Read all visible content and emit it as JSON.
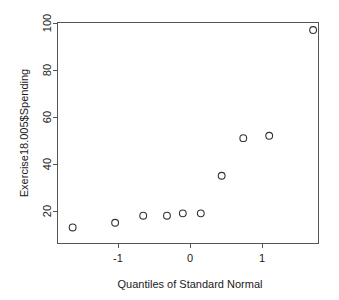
{
  "chart_data": {
    "type": "scatter",
    "title": "",
    "subtitle": "",
    "xlabel": "Quantiles of Standard Normal",
    "ylabel": "Exercise18.005$Spending",
    "xlim": [
      -1.95,
      1.95
    ],
    "ylim": [
      10.0,
      101.5
    ],
    "xticks": [
      -1,
      0,
      1
    ],
    "xtick_labels": [
      "-1",
      "0",
      "1"
    ],
    "yticks": [
      20,
      40,
      60,
      80,
      100
    ],
    "ytick_labels": [
      "20",
      "40",
      "60",
      "80",
      "100"
    ],
    "grid": false,
    "legend": null,
    "marker": "open-circle",
    "series": [
      {
        "name": "Spending quantiles",
        "x": [
          -1.63,
          -1.04,
          -0.65,
          -0.32,
          -0.1,
          0.15,
          0.44,
          0.74,
          1.1,
          1.71
        ],
        "y": [
          13,
          15,
          18,
          18,
          19,
          19,
          35,
          51,
          52,
          97
        ]
      }
    ]
  },
  "axes": {
    "x_axis_name": "Quantiles of Standard Normal",
    "y_axis_name": "Exercise18.005$Spending"
  },
  "figure": {
    "background_color": "#ffffff",
    "frame_color": "#555555",
    "point_color": "#333333"
  }
}
